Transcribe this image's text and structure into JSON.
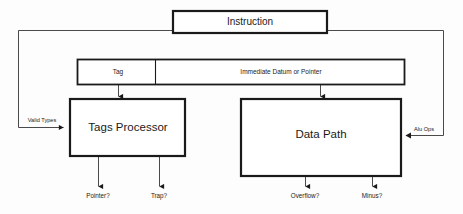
{
  "diagram": {
    "colors": {
      "background": "#fdfdfd",
      "stroke": "#1a1a1a",
      "thin_stroke": "#4a4a4a",
      "text": "#1a1a1a",
      "box_fill": "#ffffff"
    },
    "blocks": [
      {
        "id": "instruction",
        "label": "Instruction"
      },
      {
        "id": "tag",
        "label": "Tag"
      },
      {
        "id": "immediate",
        "label": "Immediate Datum or Pointer"
      },
      {
        "id": "tags-processor",
        "label": "Tags Processor"
      },
      {
        "id": "data-path",
        "label": "Data Path"
      }
    ],
    "edge_labels": [
      {
        "id": "valid-types",
        "label": "Valid Types"
      },
      {
        "id": "alu-ops",
        "label": "Alu Ops"
      }
    ],
    "outputs": [
      {
        "id": "pointer",
        "label": "Pointer?"
      },
      {
        "id": "trap",
        "label": "Trap?"
      },
      {
        "id": "overflow",
        "label": "Overflow?"
      },
      {
        "id": "minus",
        "label": "Minus?"
      }
    ]
  }
}
